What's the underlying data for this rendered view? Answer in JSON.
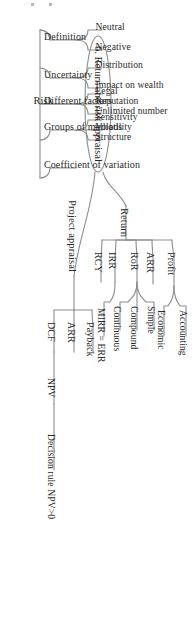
{
  "diagram": {
    "type": "mind-map",
    "orientation": "rotated-90-clockwise",
    "line_color": "#8d8d8d",
    "text_color": "#2b2b2b",
    "root": {
      "label": "6. Return and risk appraisal"
    },
    "branches": [
      {
        "label": "Return",
        "children": [
          {
            "label": "Profit",
            "children": [
              {
                "label": "Accounting"
              },
              {
                "label": "Economic"
              }
            ]
          },
          {
            "label": "ARR",
            "children": []
          },
          {
            "label": "RoR",
            "children": [
              {
                "label": "Simple"
              },
              {
                "label": "Compound"
              },
              {
                "label": "Continuous"
              }
            ]
          },
          {
            "label": "IRR",
            "children": [
              {
                "label": "MIRR = ERR"
              }
            ]
          },
          {
            "label": "RCY",
            "children": []
          }
        ]
      },
      {
        "label": "Project appraisal",
        "children": [
          {
            "label": "Payback",
            "children": []
          },
          {
            "label": "ARR",
            "children": []
          },
          {
            "label": "DCF",
            "children": [
              {
                "label": "NPV",
                "children": [
                  {
                    "label": "Decision rule NPV>0"
                  }
                ]
              }
            ]
          }
        ]
      },
      {
        "label": "Risk",
        "children": [
          {
            "label": "Definition",
            "children": [
              {
                "label": "Neutral"
              },
              {
                "label": "Negative"
              }
            ]
          },
          {
            "label": "Uncertainty",
            "children": [
              {
                "label": "Distribution"
              },
              {
                "label": "Impact on wealth"
              }
            ]
          },
          {
            "label": "Different factors",
            "children": [
              {
                "label": "Legal"
              },
              {
                "label": "Reputation"
              },
              {
                "label": "Unlimited number"
              }
            ]
          },
          {
            "label": "Groups of methods",
            "children": [
              {
                "label": "Sensitivity"
              },
              {
                "label": "Volatility"
              },
              {
                "label": "Structure"
              }
            ]
          },
          {
            "label": "Coefficient of variation",
            "children": []
          }
        ]
      }
    ]
  }
}
